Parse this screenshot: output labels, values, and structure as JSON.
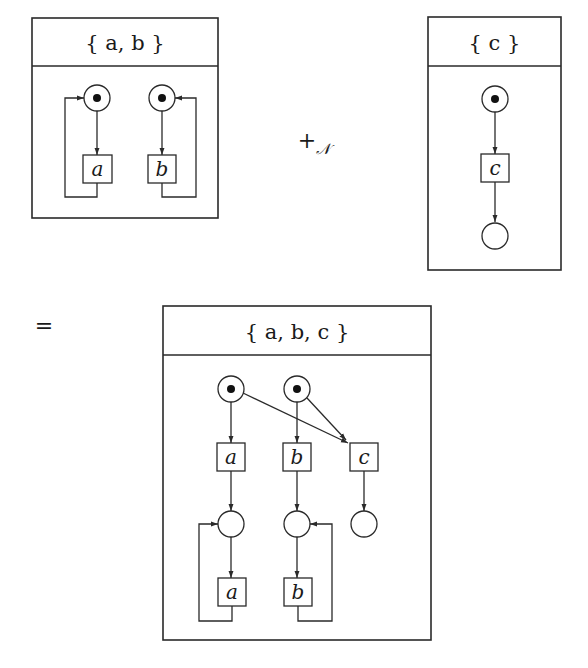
{
  "colors": {
    "ink": "#2a2a2a",
    "token": "#111111",
    "background": "#ffffff"
  },
  "operator_plus": "+",
  "operator_plus_subscript": "𝒩",
  "operator_equals": "=",
  "nets": [
    {
      "id": "net_ab",
      "title": "{ a, b }",
      "places": [
        {
          "id": "p1",
          "marked": true
        },
        {
          "id": "p2",
          "marked": true
        }
      ],
      "transitions": [
        {
          "id": "t_a",
          "label": "a"
        },
        {
          "id": "t_b",
          "label": "b"
        }
      ],
      "arcs": [
        [
          "p1",
          "t_a"
        ],
        [
          "t_a",
          "p1"
        ],
        [
          "p2",
          "t_b"
        ],
        [
          "t_b",
          "p2"
        ]
      ]
    },
    {
      "id": "net_c",
      "title": "{ c }",
      "places": [
        {
          "id": "p3",
          "marked": true
        },
        {
          "id": "p4",
          "marked": false
        }
      ],
      "transitions": [
        {
          "id": "t_c",
          "label": "c"
        }
      ],
      "arcs": [
        [
          "p3",
          "t_c"
        ],
        [
          "t_c",
          "p4"
        ]
      ]
    },
    {
      "id": "net_abc",
      "title": "{ a, b, c }",
      "places": [
        {
          "id": "q1",
          "marked": true
        },
        {
          "id": "q2",
          "marked": true
        },
        {
          "id": "q3",
          "marked": false
        },
        {
          "id": "q4",
          "marked": false
        },
        {
          "id": "q5",
          "marked": false
        }
      ],
      "transitions": [
        {
          "id": "u_a1",
          "label": "a"
        },
        {
          "id": "u_b1",
          "label": "b"
        },
        {
          "id": "u_c",
          "label": "c"
        },
        {
          "id": "u_a2",
          "label": "a"
        },
        {
          "id": "u_b2",
          "label": "b"
        }
      ],
      "arcs": [
        [
          "q1",
          "u_a1"
        ],
        [
          "q1",
          "u_c"
        ],
        [
          "q2",
          "u_b1"
        ],
        [
          "q2",
          "u_c"
        ],
        [
          "u_a1",
          "q3"
        ],
        [
          "u_b1",
          "q4"
        ],
        [
          "u_c",
          "q5"
        ],
        [
          "q3",
          "u_a2"
        ],
        [
          "u_a2",
          "q3"
        ],
        [
          "q4",
          "u_b2"
        ],
        [
          "u_b2",
          "q4"
        ]
      ]
    }
  ]
}
